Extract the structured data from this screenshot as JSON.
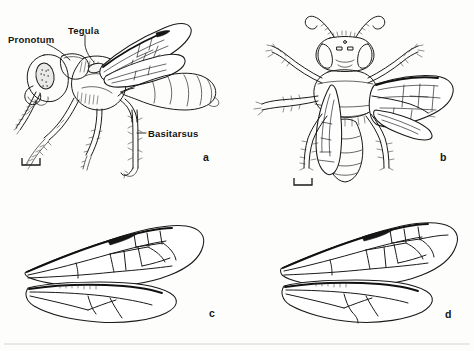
{
  "figure": {
    "kind": "scientific-line-drawing-plate",
    "background_color": "#fdfdfc",
    "ink_color": "#1a1a1a",
    "panel_count": 4
  },
  "annotations": [
    {
      "id": "pronotum",
      "text": "Pronotum",
      "x": 8,
      "y": 35,
      "panel": "a"
    },
    {
      "id": "tegula",
      "text": "Tegula",
      "x": 68,
      "y": 26,
      "panel": "a"
    },
    {
      "id": "basitarsus",
      "text": "Basitarsus",
      "x": 148,
      "y": 129,
      "panel": "a"
    }
  ],
  "panels": [
    {
      "id": "a",
      "letter": "a",
      "letter_x": 203,
      "letter_y": 152,
      "view": "lateral habitus",
      "has_scalebar": true
    },
    {
      "id": "b",
      "letter": "b",
      "letter_x": 440,
      "letter_y": 152,
      "view": "dorsal habitus",
      "has_scalebar": true
    },
    {
      "id": "c",
      "letter": "c",
      "letter_x": 209,
      "letter_y": 308,
      "view": "fore and hind wing venation",
      "has_scalebar": false
    },
    {
      "id": "d",
      "letter": "d",
      "letter_x": 445,
      "letter_y": 309,
      "view": "fore and hind wing venation",
      "has_scalebar": false
    }
  ],
  "scalebars": [
    {
      "panel": "a",
      "x": 22,
      "y": 158,
      "width": 18,
      "height": 7
    },
    {
      "panel": "b",
      "x": 294,
      "y": 178,
      "width": 18,
      "height": 7
    }
  ]
}
